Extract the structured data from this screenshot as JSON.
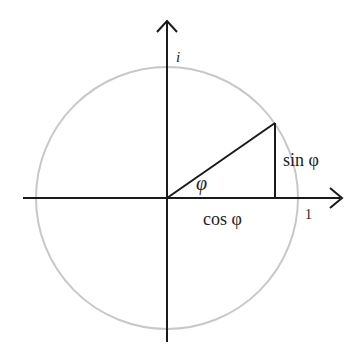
{
  "diagram": {
    "labels": {
      "imaginary_axis": "i",
      "real_unit": "1",
      "angle": "φ",
      "sine": "sin φ",
      "cosine": "cos φ"
    },
    "angle_degrees": 35,
    "colors": {
      "axes": "#1a1a1a",
      "circle": "#c8c8c8",
      "triangle": "#1a1a1a",
      "text": "#222222"
    }
  }
}
